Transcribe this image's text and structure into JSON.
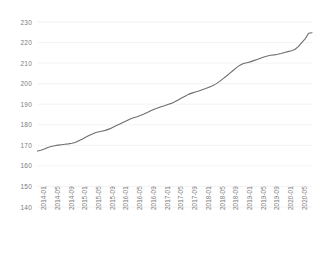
{
  "chart_data": {
    "type": "line",
    "title": "",
    "subtitle": "",
    "xlabel": "",
    "ylabel": "",
    "grid": true,
    "grid_axis": "y",
    "legend": false,
    "legend_position": "none",
    "line_color": "#6e6e6e",
    "line_width": 1.1,
    "markers": false,
    "ylim": [
      140,
      230
    ],
    "yticks": [
      140,
      150,
      160,
      170,
      180,
      190,
      200,
      210,
      220,
      230
    ],
    "ytick_labels": [
      "140",
      "150",
      "160",
      "170",
      "180",
      "190",
      "200",
      "210",
      "220",
      "230"
    ],
    "xtick_labels": [
      "2014-01",
      "2014-05",
      "2014-09",
      "2015-01",
      "2015-05",
      "2015-09",
      "2016-01",
      "2016-05",
      "2016-09",
      "2017-01",
      "2017-05",
      "2017-09",
      "2018-01",
      "2018-05",
      "2018-09",
      "2019-01",
      "2019-05",
      "2019-09",
      "2020-01",
      "2020-05"
    ],
    "xtick_interval_months": 4,
    "x": [
      "2014-01",
      "2014-02",
      "2014-03",
      "2014-04",
      "2014-05",
      "2014-06",
      "2014-07",
      "2014-08",
      "2014-09",
      "2014-10",
      "2014-11",
      "2014-12",
      "2015-01",
      "2015-02",
      "2015-03",
      "2015-04",
      "2015-05",
      "2015-06",
      "2015-07",
      "2015-08",
      "2015-09",
      "2015-10",
      "2015-11",
      "2015-12",
      "2016-01",
      "2016-02",
      "2016-03",
      "2016-04",
      "2016-05",
      "2016-06",
      "2016-07",
      "2016-08",
      "2016-09",
      "2016-10",
      "2016-11",
      "2016-12",
      "2017-01",
      "2017-02",
      "2017-03",
      "2017-04",
      "2017-05",
      "2017-06",
      "2017-07",
      "2017-08",
      "2017-09",
      "2017-10",
      "2017-11",
      "2017-12",
      "2018-01",
      "2018-02",
      "2018-03",
      "2018-04",
      "2018-05",
      "2018-06",
      "2018-07",
      "2018-08",
      "2018-09",
      "2018-10",
      "2018-11",
      "2018-12",
      "2019-01",
      "2019-02",
      "2019-03",
      "2019-04",
      "2019-05",
      "2019-06",
      "2019-07",
      "2019-08",
      "2019-09",
      "2019-10",
      "2019-11",
      "2019-12",
      "2020-01",
      "2020-02",
      "2020-03",
      "2020-04",
      "2020-05",
      "2020-06",
      "2020-07"
    ],
    "series": [
      {
        "name": "Index",
        "values": [
          167.2,
          167.6,
          168.2,
          168.9,
          169.4,
          169.8,
          170.1,
          170.3,
          170.5,
          170.7,
          171.0,
          171.4,
          172.2,
          173.0,
          173.9,
          174.8,
          175.5,
          176.2,
          176.6,
          177.0,
          177.4,
          178.0,
          178.8,
          179.6,
          180.4,
          181.2,
          182.0,
          182.8,
          183.4,
          183.9,
          184.5,
          185.2,
          186.0,
          186.8,
          187.5,
          188.2,
          188.8,
          189.3,
          189.9,
          190.4,
          191.2,
          192.1,
          193.0,
          193.9,
          194.8,
          195.4,
          195.9,
          196.4,
          197.0,
          197.6,
          198.3,
          199.0,
          199.9,
          201.0,
          202.3,
          203.6,
          205.0,
          206.4,
          207.8,
          209.0,
          209.8,
          210.2,
          210.6,
          211.2,
          211.8,
          212.4,
          213.0,
          213.5,
          213.8,
          214.0,
          214.3,
          214.7,
          215.2,
          215.6,
          216.0,
          216.6,
          218.0,
          220.0,
          221.8
        ]
      }
    ],
    "end_plateau": {
      "from": "2020-05",
      "to": "2020-07",
      "value": 224.8
    },
    "value_range_observed": [
      167.2,
      225.0
    ]
  },
  "axes": {
    "y_axis_name": "y-axis",
    "x_axis_name": "x-axis",
    "tick_color": "#7b7b7b",
    "gridline_color": "#f0f0f0",
    "plot_background": "#ffffff"
  }
}
